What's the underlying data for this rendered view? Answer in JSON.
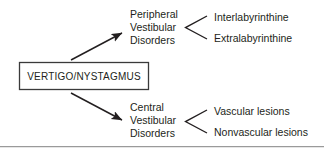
{
  "diagram": {
    "type": "flowchart",
    "root": {
      "label": "VERTIGO/NYSTAGMUS",
      "shape": "rectangle"
    },
    "branches": [
      {
        "label_lines": [
          "Peripheral",
          "Vestibular",
          "Disorders"
        ],
        "line1": "Peripheral",
        "line2": "Vestibular",
        "line3": "Disorders",
        "leaves": [
          "Interlabyrinthine",
          "Extralabyrinthine"
        ]
      },
      {
        "label_lines": [
          "Central",
          "Vestibular",
          "Disorders"
        ],
        "line1": "Central",
        "line2": "Vestibular",
        "line3": "Disorders",
        "leaves": [
          "Vascular lesions",
          "Nonvascular lesions"
        ]
      }
    ],
    "leaves": {
      "interlabyrinthine": "Interlabyrinthine",
      "extralabyrinthine": "Extralabyrinthine",
      "vascular": "Vascular lesions",
      "nonvascular": "Nonvascular lesions"
    },
    "colors": {
      "background": "#ffffff",
      "text": "#231f20",
      "stroke": "#231f20",
      "box_border": "#3a3a3a",
      "rule": "#9a9a9a"
    }
  }
}
